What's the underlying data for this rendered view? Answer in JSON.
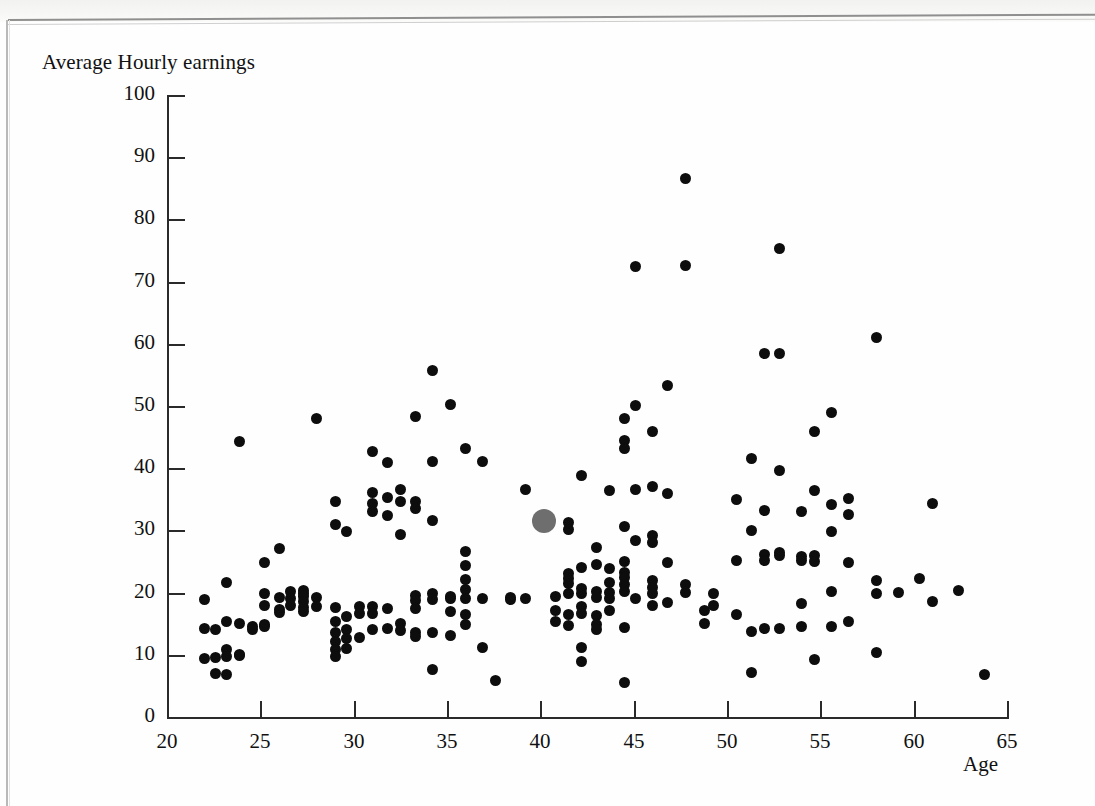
{
  "figure": {
    "ylabel": "Average Hourly earnings",
    "xlabel": "Age"
  },
  "chart_data": {
    "type": "scatter",
    "title": "",
    "xlabel": "Age",
    "ylabel": "Average Hourly earnings",
    "xlim": [
      20,
      65
    ],
    "ylim": [
      0,
      100
    ],
    "xticks": [
      20,
      25,
      30,
      35,
      40,
      45,
      50,
      55,
      60,
      65
    ],
    "yticks": [
      0,
      10,
      20,
      30,
      40,
      50,
      60,
      70,
      80,
      90,
      100
    ],
    "xtick_labels": [
      "20",
      "25",
      "30",
      "35",
      "40",
      "45",
      "50",
      "55",
      "60",
      "65"
    ],
    "ytick_labels": [
      "0",
      "10",
      "20",
      "30",
      "40",
      "50",
      "60",
      "70",
      "80",
      "90",
      "100"
    ],
    "grid": false,
    "legend": null,
    "series": [
      {
        "name": "individuals",
        "marker": "filled-circle",
        "color": "#0d0d0d",
        "marker_size_px": 11,
        "points": [
          [
            22.0,
            18.9
          ],
          [
            22.0,
            14.3
          ],
          [
            22.0,
            9.4
          ],
          [
            22.6,
            14.1
          ],
          [
            22.6,
            9.6
          ],
          [
            22.6,
            7.0
          ],
          [
            23.2,
            21.6
          ],
          [
            23.2,
            15.4
          ],
          [
            23.2,
            10.8
          ],
          [
            23.2,
            9.8
          ],
          [
            23.2,
            6.9
          ],
          [
            23.9,
            44.3
          ],
          [
            23.9,
            15.0
          ],
          [
            23.9,
            10.1
          ],
          [
            23.9,
            9.9
          ],
          [
            24.6,
            14.6
          ],
          [
            24.6,
            14.0
          ],
          [
            25.2,
            24.9
          ],
          [
            25.2,
            19.9
          ],
          [
            25.2,
            18.0
          ],
          [
            25.2,
            14.9
          ],
          [
            25.2,
            14.6
          ],
          [
            26.0,
            27.1
          ],
          [
            26.0,
            19.2
          ],
          [
            26.0,
            17.3
          ],
          [
            26.0,
            16.8
          ],
          [
            26.6,
            20.1
          ],
          [
            26.6,
            19.1
          ],
          [
            26.6,
            18.0
          ],
          [
            27.3,
            20.4
          ],
          [
            27.3,
            19.9
          ],
          [
            27.3,
            19.4
          ],
          [
            27.3,
            18.5
          ],
          [
            27.3,
            17.6
          ],
          [
            27.3,
            16.9
          ],
          [
            28.0,
            48.0
          ],
          [
            28.0,
            19.2
          ],
          [
            28.0,
            17.8
          ],
          [
            29.0,
            34.6
          ],
          [
            29.0,
            31.0
          ],
          [
            29.0,
            17.6
          ],
          [
            29.0,
            15.3
          ],
          [
            29.0,
            13.6
          ],
          [
            29.0,
            12.1
          ],
          [
            29.0,
            10.8
          ],
          [
            29.0,
            9.8
          ],
          [
            29.6,
            29.8
          ],
          [
            29.6,
            16.2
          ],
          [
            29.6,
            14.1
          ],
          [
            29.6,
            12.7
          ],
          [
            29.6,
            11.0
          ],
          [
            30.3,
            17.8
          ],
          [
            30.3,
            16.6
          ],
          [
            30.3,
            12.8
          ],
          [
            31.0,
            42.7
          ],
          [
            31.0,
            36.1
          ],
          [
            31.0,
            34.4
          ],
          [
            31.0,
            33.0
          ],
          [
            31.0,
            17.8
          ],
          [
            31.0,
            16.6
          ],
          [
            31.0,
            14.0
          ],
          [
            31.8,
            40.9
          ],
          [
            31.8,
            35.3
          ],
          [
            31.8,
            32.4
          ],
          [
            31.8,
            17.4
          ],
          [
            31.8,
            14.2
          ],
          [
            32.5,
            36.5
          ],
          [
            32.5,
            34.6
          ],
          [
            32.5,
            29.4
          ],
          [
            32.5,
            15.0
          ],
          [
            32.5,
            13.9
          ],
          [
            33.3,
            48.3
          ],
          [
            33.3,
            34.7
          ],
          [
            33.3,
            33.5
          ],
          [
            33.3,
            19.6
          ],
          [
            33.3,
            18.8
          ],
          [
            33.3,
            17.4
          ],
          [
            33.3,
            13.6
          ],
          [
            33.3,
            12.9
          ],
          [
            34.2,
            55.7
          ],
          [
            34.2,
            41.0
          ],
          [
            34.2,
            31.6
          ],
          [
            34.2,
            19.8
          ],
          [
            34.2,
            18.9
          ],
          [
            34.2,
            13.6
          ],
          [
            34.2,
            7.6
          ],
          [
            35.2,
            50.2
          ],
          [
            35.2,
            19.3
          ],
          [
            35.2,
            19.0
          ],
          [
            35.2,
            17.0
          ],
          [
            35.2,
            13.1
          ],
          [
            36.0,
            43.1
          ],
          [
            36.0,
            26.6
          ],
          [
            36.0,
            24.4
          ],
          [
            36.0,
            22.1
          ],
          [
            36.0,
            20.5
          ],
          [
            36.0,
            19.0
          ],
          [
            36.0,
            16.4
          ],
          [
            36.0,
            14.9
          ],
          [
            36.9,
            41.1
          ],
          [
            36.9,
            19.0
          ],
          [
            36.9,
            11.2
          ],
          [
            37.6,
            5.8
          ],
          [
            38.4,
            19.2
          ],
          [
            38.4,
            18.9
          ],
          [
            39.2,
            36.5
          ],
          [
            39.2,
            19.0
          ],
          [
            40.8,
            19.4
          ],
          [
            40.8,
            17.1
          ],
          [
            40.8,
            15.3
          ],
          [
            41.5,
            31.2
          ],
          [
            41.5,
            30.1
          ],
          [
            41.5,
            23.0
          ],
          [
            41.5,
            22.2
          ],
          [
            41.5,
            21.4
          ],
          [
            41.5,
            19.8
          ],
          [
            41.5,
            16.4
          ],
          [
            41.5,
            14.7
          ],
          [
            42.2,
            38.9
          ],
          [
            42.2,
            24.0
          ],
          [
            42.2,
            20.6
          ],
          [
            42.2,
            19.9
          ],
          [
            42.2,
            17.8
          ],
          [
            42.2,
            16.6
          ],
          [
            42.2,
            11.1
          ],
          [
            42.2,
            9.0
          ],
          [
            43.0,
            27.3
          ],
          [
            43.0,
            24.5
          ],
          [
            43.0,
            20.2
          ],
          [
            43.0,
            19.2
          ],
          [
            43.0,
            16.3
          ],
          [
            43.0,
            14.9
          ],
          [
            43.0,
            14.0
          ],
          [
            43.7,
            36.4
          ],
          [
            43.7,
            23.8
          ],
          [
            43.7,
            21.6
          ],
          [
            43.7,
            20.0
          ],
          [
            43.7,
            19.0
          ],
          [
            43.7,
            17.1
          ],
          [
            44.5,
            48.0
          ],
          [
            44.5,
            44.4
          ],
          [
            44.5,
            43.1
          ],
          [
            44.5,
            30.6
          ],
          [
            44.5,
            25.0
          ],
          [
            44.5,
            23.2
          ],
          [
            44.5,
            22.5
          ],
          [
            44.5,
            21.3
          ],
          [
            44.5,
            20.2
          ],
          [
            44.5,
            14.4
          ],
          [
            44.5,
            5.6
          ],
          [
            45.1,
            72.5
          ],
          [
            45.1,
            50.1
          ],
          [
            45.1,
            36.6
          ],
          [
            45.1,
            28.3
          ],
          [
            45.1,
            19.1
          ],
          [
            46.0,
            45.9
          ],
          [
            46.0,
            37.1
          ],
          [
            46.0,
            29.2
          ],
          [
            46.0,
            28.0
          ],
          [
            46.0,
            22.0
          ],
          [
            46.0,
            20.8
          ],
          [
            46.0,
            19.8
          ],
          [
            46.0,
            18.0
          ],
          [
            46.8,
            53.3
          ],
          [
            46.8,
            36.0
          ],
          [
            46.8,
            24.8
          ],
          [
            46.8,
            18.4
          ],
          [
            47.8,
            86.5
          ],
          [
            47.8,
            72.6
          ],
          [
            47.8,
            21.3
          ],
          [
            47.8,
            20.0
          ],
          [
            48.8,
            17.2
          ],
          [
            48.8,
            15.1
          ],
          [
            49.3,
            19.8
          ],
          [
            49.3,
            17.9
          ],
          [
            50.5,
            34.9
          ],
          [
            50.5,
            25.2
          ],
          [
            50.5,
            16.4
          ],
          [
            51.3,
            41.6
          ],
          [
            51.3,
            30.0
          ],
          [
            51.3,
            13.7
          ],
          [
            51.3,
            7.1
          ],
          [
            52.0,
            58.4
          ],
          [
            52.0,
            33.2
          ],
          [
            52.0,
            26.1
          ],
          [
            52.0,
            25.2
          ],
          [
            52.0,
            14.2
          ],
          [
            52.8,
            75.3
          ],
          [
            52.8,
            58.4
          ],
          [
            52.8,
            39.6
          ],
          [
            52.8,
            26.4
          ],
          [
            52.8,
            25.9
          ],
          [
            52.8,
            14.2
          ],
          [
            54.0,
            33.0
          ],
          [
            54.0,
            25.8
          ],
          [
            54.0,
            25.2
          ],
          [
            54.0,
            18.3
          ],
          [
            54.0,
            14.6
          ],
          [
            54.7,
            45.9
          ],
          [
            54.7,
            36.4
          ],
          [
            54.7,
            25.9
          ],
          [
            54.7,
            25.0
          ],
          [
            54.7,
            9.2
          ],
          [
            55.6,
            48.9
          ],
          [
            55.6,
            34.2
          ],
          [
            55.6,
            29.8
          ],
          [
            55.6,
            20.2
          ],
          [
            55.6,
            14.6
          ],
          [
            56.5,
            35.1
          ],
          [
            56.5,
            32.5
          ],
          [
            56.5,
            24.9
          ],
          [
            56.5,
            15.4
          ],
          [
            58.0,
            61.0
          ],
          [
            58.0,
            22.0
          ],
          [
            58.0,
            19.9
          ],
          [
            58.0,
            10.3
          ],
          [
            59.2,
            20.0
          ],
          [
            60.3,
            22.2
          ],
          [
            61.0,
            34.4
          ],
          [
            61.0,
            18.5
          ],
          [
            62.4,
            20.3
          ],
          [
            63.8,
            6.9
          ]
        ]
      },
      {
        "name": "highlighted-observation",
        "marker": "filled-circle",
        "color": "#6e6e6e",
        "marker_size_px": 24,
        "points": [
          [
            40.2,
            31.5
          ]
        ]
      }
    ]
  }
}
